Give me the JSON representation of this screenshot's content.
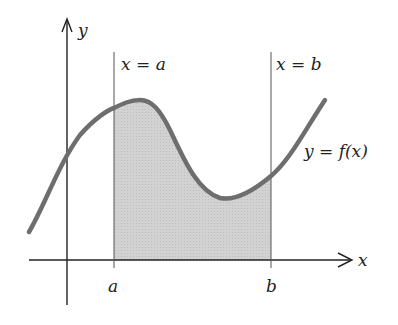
{
  "diagram": {
    "axes": {
      "x_label": "x",
      "y_label": "y"
    },
    "vertical_lines": [
      {
        "id": "a",
        "label": "x = a",
        "tick_label": "a"
      },
      {
        "id": "b",
        "label": "x = b",
        "tick_label": "b"
      }
    ],
    "curve": {
      "label": "y = f(x)"
    },
    "colors": {
      "curve": "#6e6e6e",
      "shade": "#cfcfcf",
      "axis": "#222222",
      "line": "#555555"
    }
  }
}
